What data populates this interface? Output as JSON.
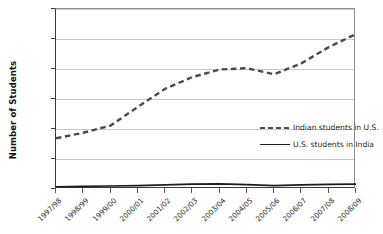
{
  "chart_data": {
    "type": "line",
    "title": "",
    "xlabel": "",
    "ylabel": "Number of Students",
    "ylim": [
      0,
      120000
    ],
    "ytick_labels": [
      "120,000",
      "100,000",
      "80,000",
      "60,000",
      "4,000",
      "20,000",
      "0"
    ],
    "ytick_values": [
      120000,
      100000,
      80000,
      60000,
      40000,
      20000,
      0
    ],
    "grid": "horizontal",
    "legend_position": "inside lower-right",
    "categories": [
      "1997/98",
      "1998/99",
      "1999/00",
      "2000/01",
      "2001/02",
      "2002/03",
      "2003/04",
      "2004/05",
      "2005/06",
      "2006/07",
      "2007/08",
      "2008/09"
    ],
    "series": [
      {
        "name": "Indian students in U.S.",
        "style": "dashed",
        "color": "#4a4a4a",
        "values": [
          33800,
          37500,
          42300,
          54700,
          66800,
          74600,
          79700,
          80500,
          76500,
          83800,
          94600,
          103300
        ]
      },
      {
        "name": "U.S. students in India",
        "style": "solid",
        "color": "#1c1c1c",
        "values": [
          1500,
          1800,
          2000,
          2200,
          2700,
          3200,
          3400,
          2900,
          2200,
          2800,
          3100,
          3200
        ]
      }
    ]
  },
  "axis": {
    "y_title": "Number of Students"
  },
  "legend": {
    "items": [
      {
        "label": "Indian students in U.S.",
        "style": "dashed"
      },
      {
        "label": "U.S. students in India",
        "style": "solid"
      }
    ]
  }
}
